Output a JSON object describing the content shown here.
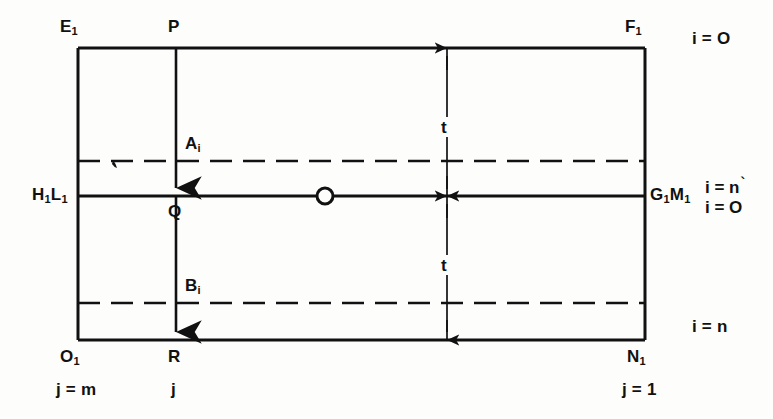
{
  "figure": {
    "type": "technical-diagram",
    "background_color": "#fdfdfc",
    "line_color": "#111111"
  },
  "corners": {
    "top_left": "E",
    "top_left_sub": "1",
    "top_right": "F",
    "top_right_sub": "1",
    "bottom_left": "O",
    "bottom_left_sub": "1",
    "bottom_right": "N",
    "bottom_right_sub": "1"
  },
  "mid_labels": {
    "left": "H",
    "left_sub": "1",
    "left2": "L",
    "left2_sub": "1",
    "right": "G",
    "right_sub": "1",
    "right2": "M",
    "right2_sub": "1"
  },
  "points": {
    "top_center": "P",
    "center": "Q",
    "bottom_center": "R",
    "upper_dashed": "A",
    "upper_dashed_sub": "i",
    "lower_dashed": "B",
    "lower_dashed_sub": "i"
  },
  "dimensions": {
    "upper_thickness": "t",
    "lower_thickness": "t"
  },
  "index_labels": {
    "top_right": "i = O",
    "mid_right_upper": "i = n",
    "mid_right_upper_tick": "`",
    "mid_right_lower": "i = O",
    "bottom_right": "i = n",
    "bottom_left": "j = m",
    "bottom_center": "j",
    "bottom_right_j": "j = 1"
  },
  "geometry": {
    "frame_left": 78,
    "frame_right": 645,
    "frame_top": 48,
    "frame_bottom": 340,
    "center_line_y": 196,
    "upper_dashed_y": 161,
    "lower_dashed_y": 303,
    "vertical_line_x": 176,
    "dimension_line_x": 447,
    "node_circle_x": 325,
    "node_circle_radius": 8
  }
}
